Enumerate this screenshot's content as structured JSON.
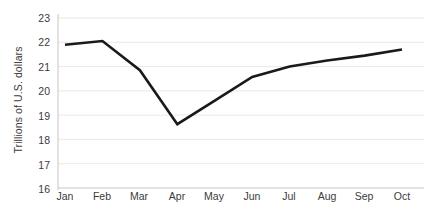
{
  "chart_data": {
    "type": "line",
    "title": "",
    "subtitle": "",
    "xlabel": "",
    "ylabel": "Trillions of U.S. dollars",
    "categories": [
      "Jan",
      "Feb",
      "Mar",
      "Apr",
      "May",
      "Jun",
      "Jul",
      "Aug",
      "Sep",
      "Oct"
    ],
    "series": [
      {
        "name": "",
        "values": [
          21.9,
          22.05,
          20.85,
          18.63,
          19.6,
          20.57,
          21.0,
          21.25,
          21.45,
          21.7
        ]
      }
    ],
    "ylim": [
      16,
      23
    ],
    "yticks": [
      16,
      17,
      18,
      19,
      20,
      21,
      22,
      23
    ],
    "ytick_labels": [
      "16",
      "17",
      "18",
      "19",
      "20",
      "21",
      "22",
      "23"
    ],
    "xtick_labels": [
      "Jan",
      "Feb",
      "Mar",
      "Apr",
      "May",
      "Jun",
      "Jul",
      "Aug",
      "Sep",
      "Oct"
    ],
    "grid": "horizontal",
    "legend": "none",
    "markers": "none",
    "line_color": "#1a1a1a",
    "grid_color": "#e2e2e2",
    "axis_color": "#bfbfbf",
    "background_color": "#ffffff",
    "text_color": "#3b3b3b",
    "annotations": []
  },
  "axis": {
    "y_title": "Trillions of U.S. dollars"
  }
}
